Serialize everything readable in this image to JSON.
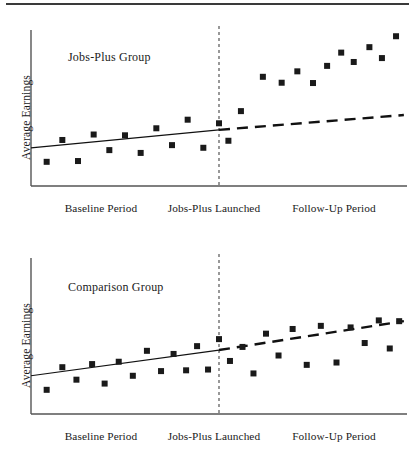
{
  "figure": {
    "has_top_rule": true,
    "marker_color": "#1a1a1a",
    "axis_color": "#555555",
    "divider_color": "#555555"
  },
  "chart_data": [
    {
      "type": "scatter",
      "title": "Jobs-Plus Group",
      "xlabel": "",
      "ylabel": "Average Earnings",
      "grid": false,
      "legend": null,
      "xlim": [
        0,
        24
      ],
      "ylim": [
        0,
        10
      ],
      "xtick_labels": [
        "Baseline Period",
        "Jobs-Plus Launched",
        "Follow-Up Period"
      ],
      "xtick_positions": [
        4.5,
        12.0,
        18.5
      ],
      "annotations": [
        {
          "text": "Jobs-Plus Launched",
          "type": "vertical-dashed-line",
          "x": 12.0
        }
      ],
      "points": [
        {
          "x": 1.0,
          "y": 1.55
        },
        {
          "x": 2.0,
          "y": 2.95
        },
        {
          "x": 3.0,
          "y": 1.6
        },
        {
          "x": 4.0,
          "y": 3.3
        },
        {
          "x": 5.0,
          "y": 2.3
        },
        {
          "x": 6.0,
          "y": 3.25
        },
        {
          "x": 7.0,
          "y": 2.12
        },
        {
          "x": 8.0,
          "y": 3.7
        },
        {
          "x": 9.0,
          "y": 2.62
        },
        {
          "x": 10.0,
          "y": 4.25
        },
        {
          "x": 11.0,
          "y": 2.45
        },
        {
          "x": 12.0,
          "y": 4.02
        },
        {
          "x": 12.6,
          "y": 2.9
        },
        {
          "x": 13.4,
          "y": 4.8
        },
        {
          "x": 14.8,
          "y": 7.0
        },
        {
          "x": 16.0,
          "y": 6.62
        },
        {
          "x": 17.0,
          "y": 7.35
        },
        {
          "x": 18.0,
          "y": 6.6
        },
        {
          "x": 18.9,
          "y": 7.7
        },
        {
          "x": 19.8,
          "y": 8.55
        },
        {
          "x": 20.6,
          "y": 7.95
        },
        {
          "x": 21.6,
          "y": 8.9
        },
        {
          "x": 22.4,
          "y": 8.2
        },
        {
          "x": 23.3,
          "y": 9.6
        }
      ],
      "trend_solid": {
        "x0": 0.0,
        "y0": 2.45,
        "x1": 12.0,
        "y1": 3.6,
        "style": "solid"
      },
      "trend_dashed": {
        "x0": 12.0,
        "y0": 3.6,
        "x1": 23.8,
        "y1": 4.55,
        "style": "dashed"
      }
    },
    {
      "type": "scatter",
      "title": "Comparison Group",
      "xlabel": "",
      "ylabel": "Average Earnings",
      "grid": false,
      "legend": null,
      "xlim": [
        0,
        24
      ],
      "ylim": [
        0,
        10
      ],
      "xtick_labels": [
        "Baseline Period",
        "Jobs-Plus Launched",
        "Follow-Up Period"
      ],
      "xtick_positions": [
        4.5,
        12.0,
        18.5
      ],
      "annotations": [
        {
          "text": "Jobs-Plus Launched",
          "type": "vertical-dashed-line",
          "x": 12.0
        }
      ],
      "points": [
        {
          "x": 1.0,
          "y": 1.55
        },
        {
          "x": 2.0,
          "y": 3.0
        },
        {
          "x": 2.9,
          "y": 2.2
        },
        {
          "x": 3.9,
          "y": 3.2
        },
        {
          "x": 4.7,
          "y": 1.95
        },
        {
          "x": 5.6,
          "y": 3.35
        },
        {
          "x": 6.5,
          "y": 2.45
        },
        {
          "x": 7.4,
          "y": 4.05
        },
        {
          "x": 8.3,
          "y": 2.75
        },
        {
          "x": 9.1,
          "y": 3.85
        },
        {
          "x": 9.9,
          "y": 2.8
        },
        {
          "x": 10.6,
          "y": 4.35
        },
        {
          "x": 11.3,
          "y": 2.85
        },
        {
          "x": 12.0,
          "y": 4.8
        },
        {
          "x": 12.7,
          "y": 3.4
        },
        {
          "x": 13.5,
          "y": 4.3
        },
        {
          "x": 14.2,
          "y": 2.6
        },
        {
          "x": 15.0,
          "y": 5.15
        },
        {
          "x": 15.8,
          "y": 3.75
        },
        {
          "x": 16.7,
          "y": 5.45
        },
        {
          "x": 17.6,
          "y": 3.15
        },
        {
          "x": 18.5,
          "y": 5.65
        },
        {
          "x": 19.5,
          "y": 3.3
        },
        {
          "x": 20.4,
          "y": 5.55
        },
        {
          "x": 21.3,
          "y": 4.55
        },
        {
          "x": 22.2,
          "y": 6.0
        },
        {
          "x": 22.9,
          "y": 4.2
        },
        {
          "x": 23.5,
          "y": 5.95
        }
      ],
      "trend_solid": {
        "x0": 0.0,
        "y0": 2.45,
        "x1": 12.0,
        "y1": 4.1,
        "style": "solid"
      },
      "trend_dashed": {
        "x0": 12.0,
        "y0": 4.1,
        "x1": 23.8,
        "y1": 5.95,
        "style": "dashed"
      }
    }
  ]
}
